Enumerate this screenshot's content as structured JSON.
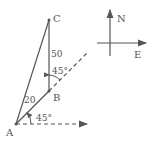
{
  "points": {
    "A": {
      "label": "A",
      "x": 16,
      "y": 124
    },
    "B": {
      "label": "B",
      "x": 49,
      "y": 91
    },
    "C": {
      "label": "C",
      "x": 49,
      "y": 20
    }
  },
  "segments": {
    "AB_length": "20",
    "BC_length": "50"
  },
  "angles": {
    "at_A": "45°",
    "at_B": "45°"
  },
  "compass": {
    "north": "N",
    "east": "E"
  },
  "colors": {
    "line": "#555555",
    "background": "#ffffff"
  }
}
